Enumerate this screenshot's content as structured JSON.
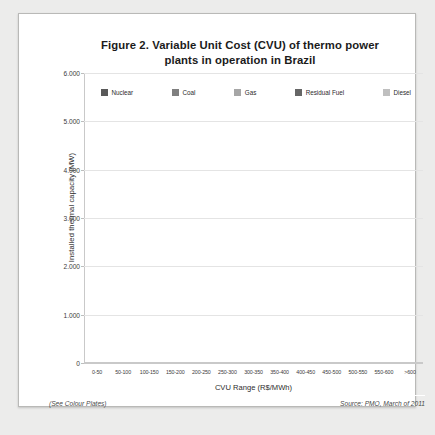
{
  "figure": {
    "title_line1": "Figure 2. Variable Unit Cost (CVU) of thermo power",
    "title_line2": "plants in operation in Brazil",
    "note_left": "(See Colour Plates)",
    "note_right": "Source: PMO, March of 2011"
  },
  "colors": {
    "nuclear": "#595959",
    "coal": "#7f7f7f",
    "gas": "#a6a6a6",
    "residual_fuel": "#666666",
    "diesel": "#bfbfbf",
    "gridline": "#e4e4e4",
    "axis": "#c9c9c9",
    "text": "#2d2d2d",
    "paper": "#ffffff"
  },
  "chart_data": {
    "type": "bar",
    "subtype": "stacked",
    "title": "Figure 2. Variable Unit Cost (CVU) of thermo power plants in operation in Brazil",
    "xlabel": "CVU Range (R$/MWh)",
    "ylabel": "Installed thermal capacity (MW)",
    "ylim": [
      0,
      6000
    ],
    "yticks": [
      0,
      1000,
      2000,
      3000,
      4000,
      5000,
      6000
    ],
    "ytick_labels": [
      "0",
      "1.000",
      "2.000",
      "3.000",
      "4.000",
      "5.000",
      "6.000"
    ],
    "grid": true,
    "legend_position": "top",
    "categories": [
      "0-50",
      "50-100",
      "100-150",
      "150-200",
      "200-250",
      "250-300",
      "300-350",
      "350-400",
      "400-450",
      "450-500",
      "500-550",
      "550-600",
      ">600"
    ],
    "series": [
      {
        "name": "Nuclear",
        "color": "#595959",
        "values": [
          2000,
          0,
          0,
          0,
          0,
          0,
          0,
          0,
          0,
          0,
          0,
          0,
          0
        ]
      },
      {
        "name": "Coal",
        "color": "#7f7f7f",
        "values": [
          0,
          350,
          750,
          500,
          0,
          0,
          0,
          0,
          0,
          0,
          0,
          0,
          150
        ]
      },
      {
        "name": "Gas",
        "color": "#a6a6a6",
        "values": [
          500,
          1750,
          3950,
          1700,
          2600,
          2650,
          1000,
          200,
          0,
          0,
          0,
          0,
          2400
        ]
      },
      {
        "name": "Residual Fuel",
        "color": "#666666",
        "values": [
          0,
          0,
          0,
          0,
          0,
          0,
          0,
          0,
          1400,
          550,
          300,
          200,
          0
        ]
      },
      {
        "name": "Diesel",
        "color": "#bfbfbf",
        "values": [
          0,
          0,
          0,
          0,
          0,
          0,
          0,
          0,
          500,
          600,
          450,
          0,
          0
        ]
      }
    ],
    "totals": [
      2500,
      2100,
      4700,
      2200,
      2600,
      2650,
      1000,
      200,
      1900,
      1150,
      750,
      200,
      2550
    ]
  }
}
